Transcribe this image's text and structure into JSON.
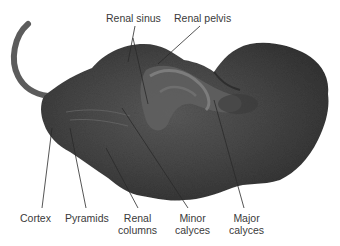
{
  "figure": {
    "labels": {
      "renal_sinus": "Renal sinus",
      "renal_pelvis": "Renal pelvis",
      "cortex": "Cortex",
      "pyramids": "Pyramids",
      "renal_columns_line1": "Renal",
      "renal_columns_line2": "columns",
      "minor_calyces_line1": "Minor",
      "minor_calyces_line2": "calyces",
      "major_calyces_line1": "Major",
      "major_calyces_line2": "calyces"
    },
    "caption_fragment": "",
    "colors": {
      "background": "#ffffff",
      "tissue_dark": "#3c3c3c",
      "tissue_mid": "#555555",
      "tissue_light": "#7a7a7a",
      "leader_line": "#2a2a2a",
      "text": "#3a3a3a"
    }
  }
}
